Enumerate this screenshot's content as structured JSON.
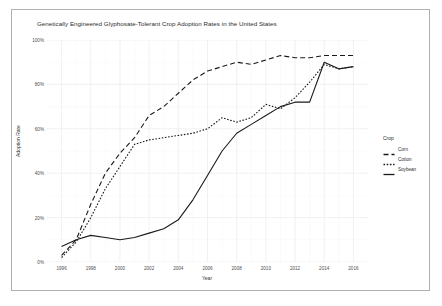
{
  "chart_data": {
    "type": "line",
    "title": "Genetically Engineered Glyphosate-Tolerant Crop Adoption Rates in the United States",
    "xlabel": "Year",
    "ylabel": "Adoption Rate",
    "xlim": [
      1995,
      2017
    ],
    "ylim": [
      0,
      100
    ],
    "xticks": [
      1996,
      1998,
      2000,
      2002,
      2004,
      2006,
      2008,
      2010,
      2012,
      2014,
      2016
    ],
    "xtick_labels": [
      "1996",
      "1998",
      "2000",
      "2002",
      "2004",
      "2006",
      "2008",
      "2010",
      "2012",
      "2014",
      "2016"
    ],
    "yticks": [
      0,
      20,
      40,
      60,
      80,
      100
    ],
    "ytick_labels": [
      "0%",
      "20%",
      "40%",
      "60%",
      "80%",
      "100%"
    ],
    "grid": true,
    "grid_color": "#ebebeb",
    "legend_position": "right",
    "legend_title": "Crop",
    "x": [
      1996,
      1997,
      1998,
      1999,
      2000,
      2001,
      2002,
      2003,
      2004,
      2005,
      2006,
      2007,
      2008,
      2009,
      2010,
      2011,
      2012,
      2013,
      2014,
      2015,
      2016
    ],
    "series": [
      {
        "name": "Corn",
        "dash": "dashed",
        "color": "#1a1a1a",
        "values": [
          3,
          10,
          26,
          40,
          49,
          56,
          66,
          70,
          76,
          82,
          86,
          88,
          90,
          89,
          91,
          93,
          92,
          92,
          93,
          93,
          93
        ]
      },
      {
        "name": "Cotton",
        "dash": "dotted",
        "color": "#1a1a1a",
        "values": [
          2,
          9,
          20,
          33,
          43,
          53,
          55,
          56,
          57,
          58,
          60,
          65,
          63,
          65,
          71,
          69,
          74,
          81,
          89,
          87,
          88
        ]
      },
      {
        "name": "Soybean",
        "dash": "solid",
        "color": "#1a1a1a",
        "values": [
          7,
          10,
          12,
          11,
          10,
          11,
          13,
          15,
          19,
          28,
          39,
          50,
          58,
          62,
          66,
          70,
          72,
          72,
          90,
          87,
          88
        ]
      }
    ]
  },
  "legend": {
    "title": "Crop",
    "items": [
      {
        "label": "Corn",
        "dash": "dashed"
      },
      {
        "label": "Cotton",
        "dash": "dotted"
      },
      {
        "label": "Soybean",
        "dash": "solid"
      }
    ]
  }
}
